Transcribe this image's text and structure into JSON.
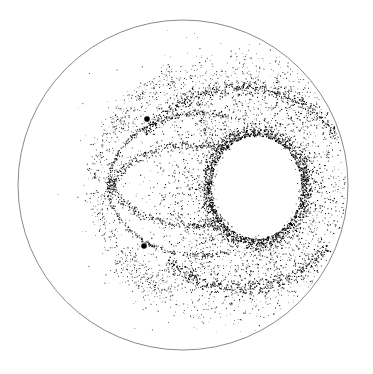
{
  "canvas": {
    "width": 373,
    "height": 374,
    "background": "#ffffff"
  },
  "boundary": {
    "cx": 183,
    "cy": 185,
    "r": 165,
    "stroke": "#8a8a8a",
    "stroke_width": 1
  },
  "point_color": "#000000",
  "hole": {
    "cx": 256,
    "cy": 187,
    "rx": 41,
    "ry": 47
  },
  "markers": [
    {
      "name": "upper-dark-dot",
      "x": 147,
      "y": 119,
      "r": 2.8
    },
    {
      "name": "lower-dark-dot",
      "x": 144,
      "y": 246,
      "r": 2.8
    }
  ],
  "bands": [
    {
      "name": "hole-rim",
      "type": "ellipse",
      "cx": 256,
      "cy": 187,
      "rx": 46,
      "ry": 52,
      "a0": 0,
      "a1": 360,
      "spread": 7,
      "n": 1900,
      "bias": "outer",
      "size": 1.0
    },
    {
      "name": "hole-halo",
      "type": "ellipse",
      "cx": 252,
      "cy": 187,
      "rx": 72,
      "ry": 78,
      "a0": 0,
      "a1": 360,
      "spread": 16,
      "n": 1400,
      "size": 0.9
    },
    {
      "name": "inner-crescent",
      "type": "ellipse",
      "cx": 265,
      "cy": 185,
      "rx": 58,
      "ry": 52,
      "a0": 130,
      "a1": 230,
      "spread": 0.6,
      "n": 110,
      "size": 0.8
    },
    {
      "name": "upper-right-arc",
      "type": "ellipse",
      "cx": 240,
      "cy": 215,
      "rx": 125,
      "ry": 128,
      "a0": 220,
      "a1": 330,
      "spread": 4,
      "n": 650,
      "size": 1.0
    },
    {
      "name": "upper-right-sparse",
      "type": "ellipse",
      "cx": 240,
      "cy": 215,
      "rx": 140,
      "ry": 145,
      "a0": 215,
      "a1": 335,
      "spread": 12,
      "n": 420,
      "size": 0.8
    },
    {
      "name": "lower-right-arc",
      "type": "ellipse",
      "cx": 240,
      "cy": 170,
      "rx": 115,
      "ry": 118,
      "a0": 40,
      "a1": 130,
      "spread": 4,
      "n": 520,
      "size": 1.0
    },
    {
      "name": "lower-sparse",
      "type": "ellipse",
      "cx": 225,
      "cy": 165,
      "rx": 135,
      "ry": 140,
      "a0": 45,
      "a1": 140,
      "spread": 14,
      "n": 380,
      "size": 0.8
    },
    {
      "name": "upper-loop",
      "type": "ellipse",
      "cx": 200,
      "cy": 185,
      "rx": 92,
      "ry": 72,
      "a0": 180,
      "a1": 290,
      "spread": 1.2,
      "n": 260,
      "size": 0.9
    },
    {
      "name": "lower-loop",
      "type": "ellipse",
      "cx": 200,
      "cy": 185,
      "rx": 92,
      "ry": 70,
      "a0": 70,
      "a1": 180,
      "spread": 1.2,
      "n": 240,
      "size": 0.9
    },
    {
      "name": "inner-upper-loop",
      "type": "ellipse",
      "cx": 190,
      "cy": 195,
      "rx": 80,
      "ry": 50,
      "a0": 185,
      "a1": 300,
      "spread": 2.5,
      "n": 300,
      "size": 0.9
    },
    {
      "name": "inner-lower-loop",
      "type": "ellipse",
      "cx": 190,
      "cy": 175,
      "rx": 80,
      "ry": 50,
      "a0": 60,
      "a1": 175,
      "spread": 2.5,
      "n": 280,
      "size": 0.9
    },
    {
      "name": "left-outer-upper",
      "type": "ellipse",
      "cx": 215,
      "cy": 180,
      "rx": 118,
      "ry": 110,
      "a0": 180,
      "a1": 250,
      "spread": 6,
      "n": 260,
      "size": 0.8
    },
    {
      "name": "left-outer-lower",
      "type": "ellipse",
      "cx": 215,
      "cy": 190,
      "rx": 118,
      "ry": 110,
      "a0": 110,
      "a1": 180,
      "spread": 6,
      "n": 240,
      "size": 0.8
    },
    {
      "name": "mid-cross-band",
      "type": "ellipse",
      "cx": 185,
      "cy": 185,
      "rx": 30,
      "ry": 90,
      "a0": -80,
      "a1": 80,
      "spread": 7,
      "n": 320,
      "size": 0.8
    },
    {
      "name": "scatter-fill",
      "type": "ellipse",
      "cx": 225,
      "cy": 185,
      "rx": 95,
      "ry": 100,
      "a0": 0,
      "a1": 360,
      "spread": 28,
      "n": 700,
      "size": 0.7
    }
  ]
}
